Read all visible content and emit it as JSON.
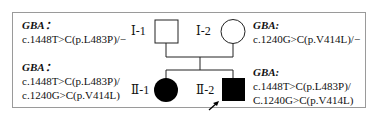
{
  "individuals": [
    {
      "id": "I-1",
      "label": "Ⅰ-1",
      "sex": "male",
      "affected": false,
      "gene": "GBA：",
      "genotype_lines": [
        "c.1448T>C(p.L483P)/−"
      ]
    },
    {
      "id": "I-2",
      "label": "Ⅰ-2",
      "sex": "female",
      "affected": false,
      "gene": "GBA:",
      "genotype_lines": [
        "c.1240G>C(p.V414L)/−"
      ]
    },
    {
      "id": "II-1",
      "label": "Ⅱ-1",
      "sex": "female",
      "affected": true,
      "gene": "GBA：",
      "genotype_lines": [
        "c.1448T>C(p.L483P)/",
        "c.1240G>C(p.V414L)"
      ]
    },
    {
      "id": "II-2",
      "label": "Ⅱ-2",
      "sex": "male",
      "affected": true,
      "proband": true,
      "gene": "GBA:",
      "genotype_lines": [
        "c.1448T>C(p.L483P)/",
        "C.1240G>C(p.V414L)"
      ]
    }
  ],
  "colors": {
    "affected": "#000000",
    "unaffected": "#ffffff",
    "line": "#222222",
    "frame": "#9a9a9a"
  }
}
